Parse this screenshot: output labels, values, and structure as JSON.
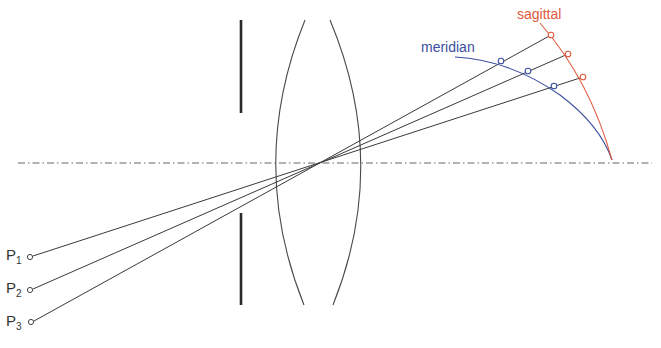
{
  "diagram": {
    "title": "",
    "colors": {
      "ray": "#3a3a3a",
      "axis": "#555555",
      "stop": "#2a2a2a",
      "lens": "#4a4a4a",
      "meridian": "#3b4fa0",
      "sagittal": "#e0583c",
      "text": "#333333"
    },
    "labels": {
      "meridian": "meridian",
      "sagittal": "sagittal"
    },
    "points": [
      {
        "letter": "P",
        "sub": "1",
        "x": 30,
        "y": 257
      },
      {
        "letter": "P",
        "sub": "2",
        "x": 30,
        "y": 290
      },
      {
        "letter": "P",
        "sub": "3",
        "x": 31,
        "y": 322
      }
    ],
    "focal_points_sagittal": [
      {
        "x": 551,
        "y": 35
      },
      {
        "x": 568,
        "y": 54
      },
      {
        "x": 583,
        "y": 77
      }
    ],
    "focal_points_meridian": [
      {
        "x": 501,
        "y": 61
      },
      {
        "x": 528,
        "y": 71
      },
      {
        "x": 554,
        "y": 86
      }
    ],
    "components": [
      "optical axis",
      "aperture stop",
      "biconvex lens",
      "principal rays",
      "meridional image surface",
      "sagittal image surface"
    ]
  }
}
